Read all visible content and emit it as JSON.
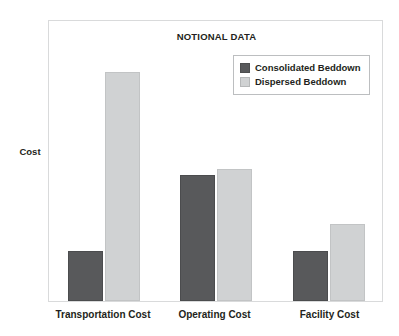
{
  "chart_data": {
    "type": "bar",
    "title": "NOTIONAL DATA",
    "xlabel": "",
    "ylabel": "Cost",
    "categories": [
      "Transportation Cost",
      "Operating Cost",
      "Facility Cost"
    ],
    "series": [
      {
        "name": "Consolidated Beddown",
        "color": "#58595B",
        "values": [
          17.7,
          44.7,
          17.7
        ]
      },
      {
        "name": "Dispersed Beddown",
        "color": "#D0D2D3",
        "values": [
          81.2,
          46.8,
          27.3
        ]
      }
    ],
    "ylim": [
      0,
      100
    ],
    "grid": false,
    "axis_tick_labels": [],
    "legend_position": "top-right"
  },
  "legend": {
    "entries": [
      {
        "label": "Consolidated Beddown",
        "swatch": "#58595B"
      },
      {
        "label": "Dispersed Beddown",
        "swatch": "#D0D2D3"
      }
    ]
  }
}
